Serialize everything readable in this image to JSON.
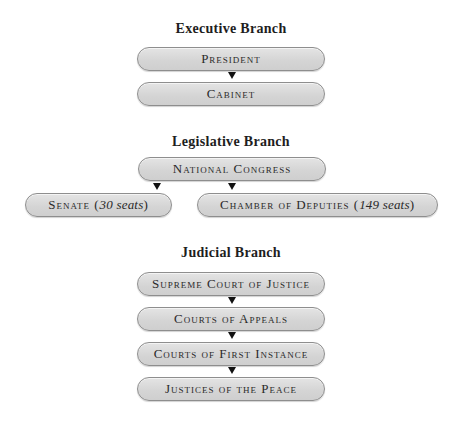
{
  "executive": {
    "heading": "Executive Branch",
    "boxes": [
      "President",
      "Cabinet"
    ]
  },
  "legislative": {
    "heading": "Legislative Branch",
    "congress": "National Congress",
    "senate": {
      "label": "Senate (",
      "seats": "30 seats",
      "close": ")"
    },
    "chamber": {
      "label": "Chamber of Deputies (",
      "seats": "149 seats",
      "close": ")"
    }
  },
  "judicial": {
    "heading": "Judicial Branch",
    "boxes": [
      "Supreme Court of Justice",
      "Courts of Appeals",
      "Courts of First Instance",
      "Justices of the Peace"
    ]
  },
  "colors": {
    "box_fill": "#d8d8d8",
    "box_border": "#8e8e8e",
    "arrow": "#111111",
    "text": "#2a2a2a"
  }
}
